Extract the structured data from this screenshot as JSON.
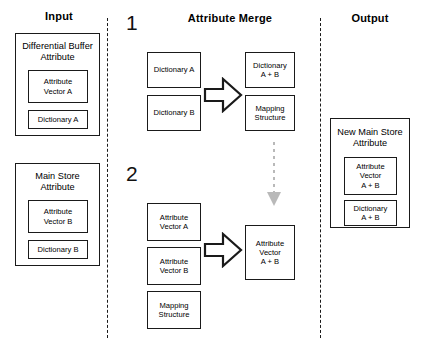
{
  "diagram": {
    "columns": {
      "input_label": "Input",
      "merge_label": "Attribute Merge",
      "output_label": "Output"
    },
    "steps": {
      "one": "1",
      "two": "2"
    },
    "input": {
      "differential_buffer": {
        "title_line1": "Differential Buffer",
        "title_line2": "Attribute",
        "items": [
          {
            "line1": "Attribute",
            "line2": "Vector A"
          },
          {
            "line1": "Dictionary A",
            "line2": ""
          }
        ]
      },
      "main_store": {
        "title_line1": "Main Store",
        "title_line2": "Attribute",
        "items": [
          {
            "line1": "Attribute",
            "line2": "Vector B"
          },
          {
            "line1": "Dictionary B",
            "line2": ""
          }
        ]
      }
    },
    "merge": {
      "step1": {
        "inputs": [
          {
            "line1": "Dictionary A",
            "line2": "",
            "line3": ""
          },
          {
            "line1": "Dictionary B",
            "line2": "",
            "line3": ""
          }
        ],
        "outputs": [
          {
            "line1": "Dictionary",
            "line2": "A + B",
            "line3": ""
          },
          {
            "line1": "Mapping",
            "line2": "Structure",
            "line3": ""
          }
        ]
      },
      "step2": {
        "inputs": [
          {
            "line1": "Attribute",
            "line2": "Vector A",
            "line3": ""
          },
          {
            "line1": "Attribute",
            "line2": "Vector B",
            "line3": ""
          },
          {
            "line1": "Mapping",
            "line2": "Structure",
            "line3": ""
          }
        ],
        "outputs": [
          {
            "line1": "Attribute",
            "line2": "Vector",
            "line3": "A + B"
          }
        ]
      }
    },
    "output": {
      "new_main_store": {
        "title_line1": "New Main Store",
        "title_line2": "Attribute",
        "items": [
          {
            "line1": "Attribute",
            "line2": "Vector",
            "line3": "A + B"
          },
          {
            "line1": "Dictionary",
            "line2": "A + B",
            "line3": ""
          }
        ]
      }
    },
    "colors": {
      "stroke": "#1a1a1a",
      "background": "#ffffff",
      "flow_arrow": "#b3b3b3"
    }
  }
}
